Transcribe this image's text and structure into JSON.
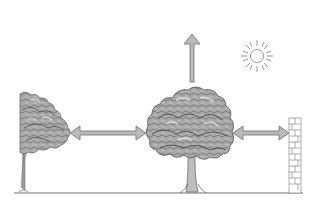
{
  "diagram": {
    "kind": "tree-spacing-illustration",
    "background": "#ffffff",
    "colors": {
      "ground_line": "#6f6f6f",
      "arrow_fill": "#b9b9b9",
      "arrow_stroke": "#7a7a7a",
      "canopy_fill": "#a9a9a9",
      "canopy_dark": "#5e5e5e",
      "canopy_light": "#d3d3d3",
      "trunk": "#9a9a9a",
      "wall_stroke": "#8a8a8a",
      "sun_stroke": "#8a8a8a"
    },
    "elements": [
      {
        "id": "left-tree",
        "label": "neighboring tree (partial)"
      },
      {
        "id": "center-tree",
        "label": "tree"
      },
      {
        "id": "brick-wall",
        "label": "wall"
      },
      {
        "id": "sun",
        "label": "sun"
      },
      {
        "id": "arrow-up",
        "label": "vertical growth space"
      },
      {
        "id": "arrow-left-gap",
        "label": "spacing to neighboring tree"
      },
      {
        "id": "arrow-right-gap",
        "label": "spacing to wall"
      }
    ]
  }
}
